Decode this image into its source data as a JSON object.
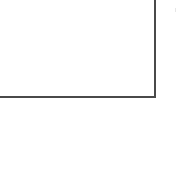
{
  "canvas": {
    "width": 177,
    "height": 180,
    "background": "#ffffff"
  },
  "shape": {
    "type": "rectangle-corner",
    "visible_edges": [
      "right",
      "bottom"
    ],
    "right_edge_x": 157,
    "bottom_edge_y": 99,
    "stroke_color": "#4a4a4a",
    "stroke_width": 2
  }
}
